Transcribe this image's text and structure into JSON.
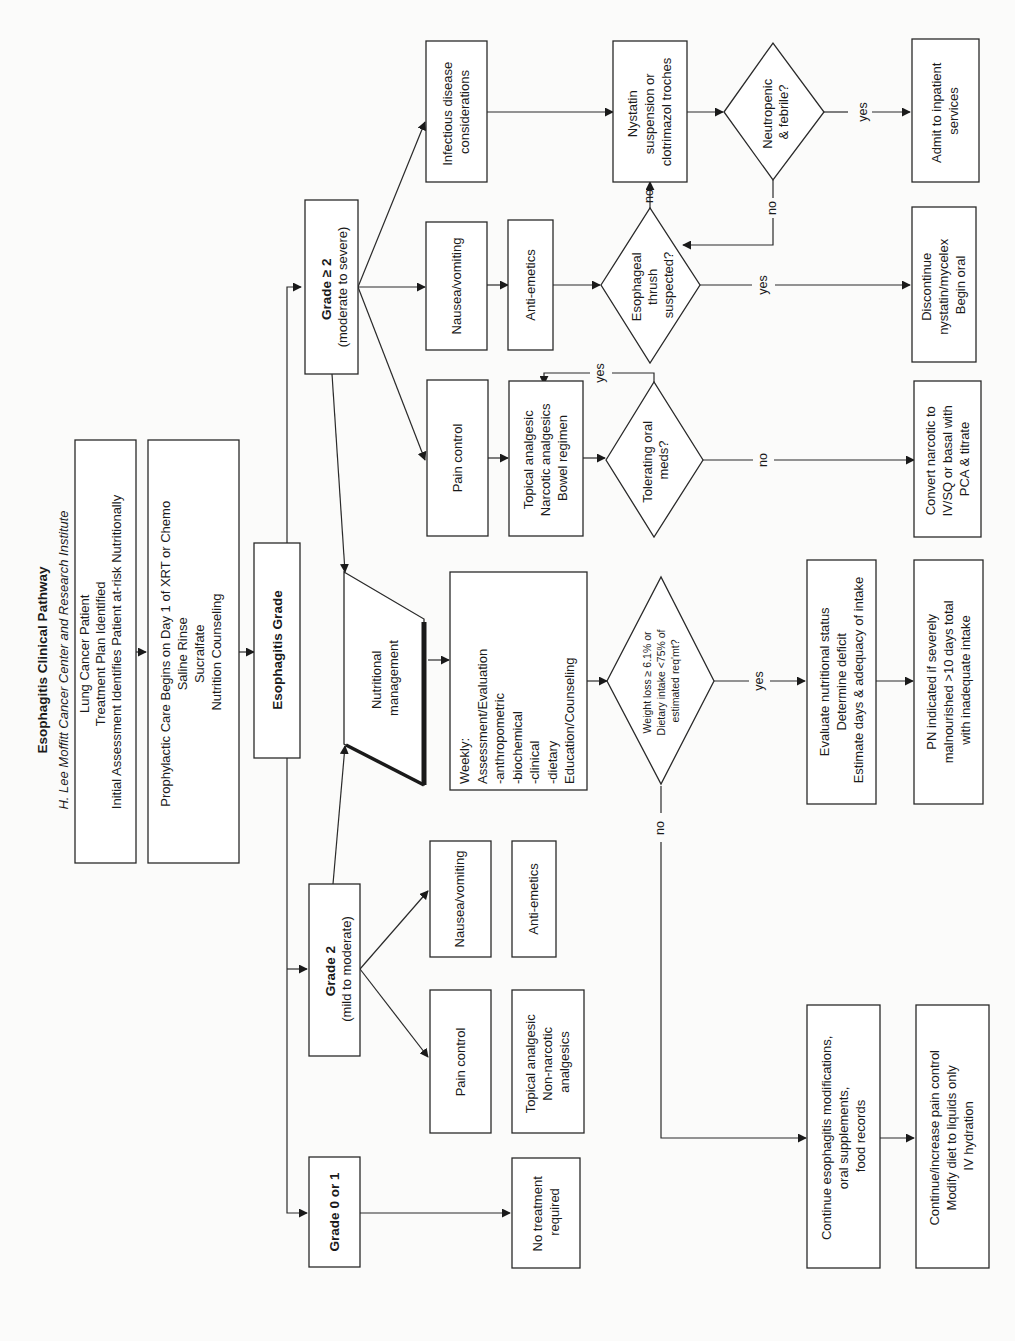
{
  "header": {
    "title": "Esophagitis Clinical Pathway",
    "subtitle": "H. Lee Moffitt Cancer Center and Research Institute"
  },
  "colors": {
    "stroke": "#2a2a2a",
    "background": "#fbfbfa",
    "box_fill": "#ffffff"
  },
  "orientation": "rotated 90° counter-clockwise",
  "nodes": {
    "intake": {
      "lines": [
        "Lung Cancer Patient",
        "Treatment Plan Identified",
        "Initial Assessment Identifies Patient at-risk Nutritionally"
      ]
    },
    "prophylactic": {
      "lines": [
        "Prophylactic Care Begins on Day 1 of XRT or Chemo",
        "Saline Rinse",
        "Sucralfate",
        "Nutrition Counseling"
      ]
    },
    "grade_hub": {
      "lines": [
        "Esophagitis Grade"
      ]
    },
    "grade_severe": {
      "lines": [
        "Grade ≥ 2",
        "(moderate to severe)"
      ]
    },
    "grade_mild": {
      "lines": [
        "Grade 2",
        "(mild to moderate)"
      ]
    },
    "grade_none": {
      "lines": [
        "Grade 0 or 1"
      ]
    },
    "infectious": {
      "lines": [
        "Infectious disease",
        "considerations"
      ]
    },
    "nausea_severe": {
      "lines": [
        "Nausea/vomiting"
      ]
    },
    "pain_severe": {
      "lines": [
        "Pain control"
      ]
    },
    "antiemetics_severe": {
      "lines": [
        "Anti-emetics"
      ]
    },
    "analgesics_severe": {
      "lines": [
        "Topical analgesic",
        "Narcotic analgesics",
        "Bowel regimen"
      ]
    },
    "nystatin": {
      "lines": [
        "Nystatin",
        "suspension or",
        "clotrimazol troches"
      ]
    },
    "neutropenic": {
      "lines": [
        "Neutropenic",
        "& febrile?"
      ]
    },
    "admit": {
      "lines": [
        "Admit to inpatient",
        "services"
      ]
    },
    "thrush": {
      "lines": [
        "Esophageal",
        "thrush",
        "suspected?"
      ]
    },
    "discontinue": {
      "lines": [
        "Discontinue",
        "nystatin/mycelex",
        "Begin oral"
      ]
    },
    "tolerating": {
      "lines": [
        "Tolerating oral",
        "meds?"
      ]
    },
    "convert": {
      "lines": [
        "Convert narcotic to",
        "IV/SQ or basal with",
        "PCA & titrate"
      ]
    },
    "nutritional_mgmt": {
      "lines": [
        "Nutritional",
        "management"
      ]
    },
    "weekly": {
      "lines": [
        "Weekly:",
        "Assessment/Evaluation",
        "-anthropometric",
        "-biochemical",
        "-clinical",
        "-dietary",
        "Education/Counseling"
      ]
    },
    "weight_loss": {
      "lines": [
        "Weight loss ≥ 6.1% or",
        "Dietary intake <75% of",
        "estimated req'mt?"
      ]
    },
    "evaluate": {
      "lines": [
        "Evaluate nutritional status",
        "Determine deficit",
        "Estimate days &  adequacy of intake"
      ]
    },
    "pn": {
      "lines": [
        "PN indicated if severely",
        "malnourished >10 days total",
        "with inadequate intake"
      ]
    },
    "nausea_mild": {
      "lines": [
        "Nausea/vomiting"
      ]
    },
    "pain_mild": {
      "lines": [
        "Pain control"
      ]
    },
    "antiemetics_mild": {
      "lines": [
        "Anti-emetics"
      ]
    },
    "analgesics_mild": {
      "lines": [
        "Topical analgesic",
        "Non-narcotic",
        "analgesics"
      ]
    },
    "no_treatment": {
      "lines": [
        "No treatment",
        "required"
      ]
    },
    "continue_mods": {
      "lines": [
        "Continue esophagitis modifications,",
        "oral supplements,",
        "food records"
      ]
    },
    "continue_pain": {
      "lines": [
        "Continue/increase pain control",
        "Modify diet to liquids only",
        "IV hydration"
      ]
    }
  },
  "edge_labels": {
    "neutropenic_yes": "yes",
    "neutropenic_no": "no",
    "thrush_yes": "yes",
    "thrush_no": "no",
    "tolerating_yes": "yes",
    "tolerating_no": "no",
    "weight_yes": "yes",
    "weight_no": "no"
  }
}
